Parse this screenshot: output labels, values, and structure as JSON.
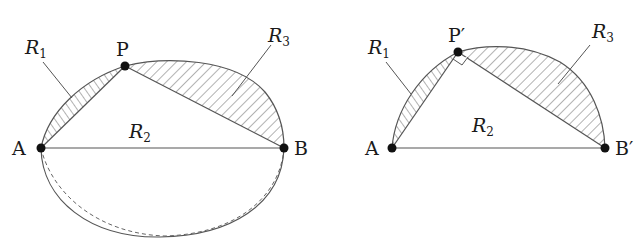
{
  "figures": [
    {
      "id": "left",
      "points": {
        "A": {
          "label": "A",
          "x": 41,
          "y": 148
        },
        "B": {
          "label": "B",
          "x": 284,
          "y": 148
        },
        "P": {
          "label": "P",
          "x": 125,
          "y": 66
        }
      },
      "regions": {
        "R1": {
          "main": "R",
          "sub": "1",
          "hatch": "vertical"
        },
        "R2": {
          "main": "R",
          "sub": "2",
          "hatch": "none"
        },
        "R3": {
          "main": "R",
          "sub": "3",
          "hatch": "diagonal"
        }
      },
      "curves": [
        "upper arc A-P-B (solid)",
        "lower arc A-B (solid)",
        "lower arc A-B (dashed)",
        "chord A-B",
        "chord A-P",
        "chord P-B"
      ]
    },
    {
      "id": "right",
      "points": {
        "A": {
          "label": "A",
          "x": 392,
          "y": 148
        },
        "B": {
          "label": "B′",
          "x": 605,
          "y": 148
        },
        "P": {
          "label": "P′",
          "x": 458,
          "y": 52
        }
      },
      "regions": {
        "R1": {
          "main": "R",
          "sub": "1",
          "hatch": "vertical"
        },
        "R2": {
          "main": "R",
          "sub": "2",
          "hatch": "none"
        },
        "R3": {
          "main": "R",
          "sub": "3",
          "hatch": "diagonal"
        }
      },
      "annotations": [
        "right-angle mark at P′"
      ],
      "curves": [
        "semicircle arc A-P′-B′ (solid)",
        "chord A-B′",
        "chord A-P′",
        "chord P′-B′"
      ]
    }
  ],
  "colors": {
    "stroke": "#555555",
    "point": "#111111",
    "hatch": "#666666",
    "background": "#ffffff"
  }
}
